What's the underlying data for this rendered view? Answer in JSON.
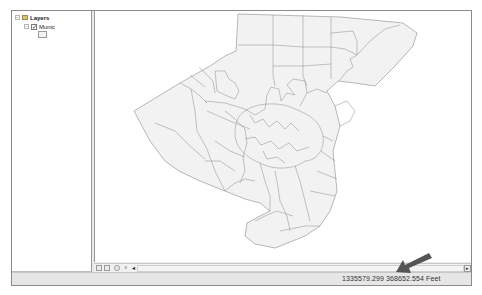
{
  "toc": {
    "root_label": "Layers",
    "layers": [
      {
        "label": "Munic",
        "checked": true,
        "symbol": "polygon-swatch"
      }
    ]
  },
  "map": {
    "layer": "Munic",
    "fill_color": "#f2f2f2",
    "outline_color": "#7a7a7a",
    "background": "#ffffff"
  },
  "bottom_toolbar": {
    "buttons": [
      {
        "name": "data-view-button",
        "glyph": "▫"
      },
      {
        "name": "layout-view-button",
        "glyph": "▫"
      },
      {
        "name": "refresh-button",
        "glyph": "◌"
      },
      {
        "name": "pause-drawing-button",
        "glyph": "॥"
      }
    ],
    "scroll_left_glyph": "◂",
    "scroll_right_glyph": "▸"
  },
  "status": {
    "x": "1335579.299",
    "y": "368652.554",
    "units": "Feet",
    "coords_text": "1335579.299  368652.554 Feet"
  },
  "annotation": {
    "arrow_color": "#555555",
    "points_to": "coordinates"
  }
}
